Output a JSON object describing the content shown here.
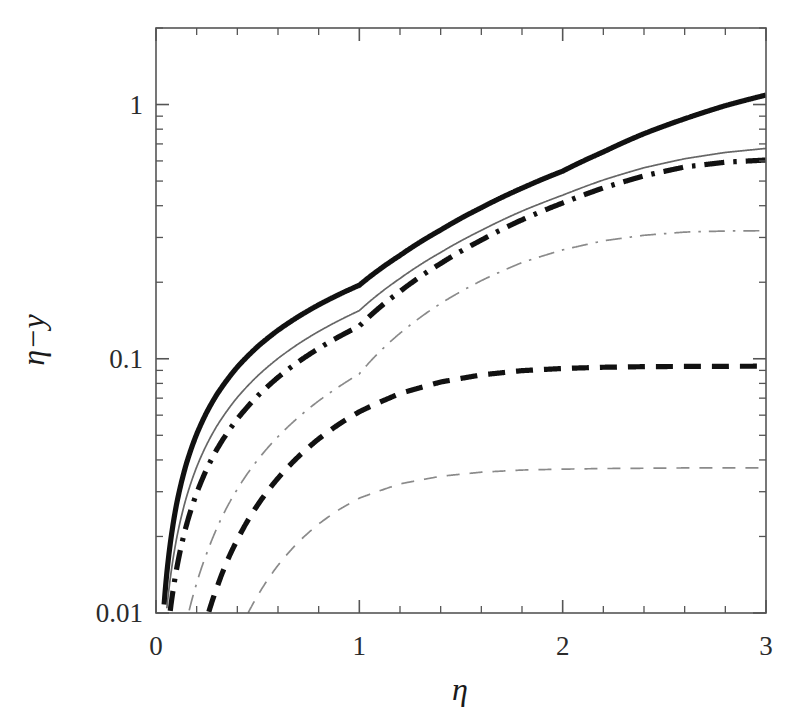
{
  "figure": {
    "background_color": "#ffffff",
    "ink_color": "#1a1a1a",
    "light_ink_color": "#6a6a6a",
    "axis_color": "#555555"
  },
  "axes": {
    "x_label": "η",
    "y_label": "η−y",
    "x_scale": "linear",
    "y_scale": "log",
    "xlim": [
      0,
      3
    ],
    "ylim": [
      0.01,
      2.0
    ],
    "x_major_ticks": [
      0,
      1,
      2,
      3
    ],
    "x_major_tick_labels": [
      "0",
      "1",
      "2",
      "3"
    ],
    "x_minor_tick_step": 0.2,
    "y_major_ticks": [
      0.01,
      0.1,
      1
    ],
    "y_major_tick_labels": [
      "0.01",
      "0.1",
      "1"
    ],
    "y_minor_decade_multipliers": [
      2,
      3,
      4,
      5,
      6,
      7,
      8,
      9
    ],
    "grid": false,
    "frame": "box",
    "ticks_direction": "in"
  },
  "chart_data": {
    "type": "line",
    "title": "",
    "subtitle": "",
    "xlabel": "η",
    "ylabel": "η−y",
    "xlim": [
      0,
      3
    ],
    "ylim": [
      0.01,
      2.0
    ],
    "x_scale": "linear",
    "y_scale": "log",
    "grid": false,
    "legend": "none",
    "annotations": [],
    "x": [
      0.0,
      0.05,
      0.1,
      0.15,
      0.2,
      0.25,
      0.3,
      0.4,
      0.5,
      0.6,
      0.7,
      0.8,
      0.9,
      1.0,
      1.2,
      1.4,
      1.6,
      1.8,
      2.0,
      2.2,
      2.4,
      2.6,
      2.8,
      3.0
    ],
    "series": [
      {
        "name": "curve-1",
        "style": "solid",
        "width": "thick",
        "color": "#111111",
        "asymptote": 1.09,
        "values": [
          0.0,
          0.0135,
          0.0265,
          0.0388,
          0.0505,
          0.0617,
          0.0725,
          0.0928,
          0.1117,
          0.1295,
          0.1465,
          0.163,
          0.179,
          0.1947,
          0.255,
          0.321,
          0.393,
          0.469,
          0.547,
          0.651,
          0.768,
          0.879,
          0.99,
          1.09
        ]
      },
      {
        "name": "curve-2",
        "style": "solid",
        "width": "thin",
        "color": "#666666",
        "asymptote": 0.672,
        "values": [
          0.0,
          0.0098,
          0.0194,
          0.0286,
          0.0375,
          0.0461,
          0.0545,
          0.0705,
          0.0857,
          0.1003,
          0.1144,
          0.1281,
          0.1415,
          0.1547,
          0.207,
          0.262,
          0.32,
          0.381,
          0.44,
          0.505,
          0.564,
          0.612,
          0.648,
          0.672
        ]
      },
      {
        "name": "curve-3",
        "style": "dash-dot",
        "width": "thick",
        "color": "#111111",
        "asymptote": 0.605,
        "values": [
          0.0,
          0.0072,
          0.0147,
          0.0222,
          0.0296,
          0.0369,
          0.0441,
          0.058,
          0.0714,
          0.0845,
          0.0973,
          0.1098,
          0.1222,
          0.1344,
          0.184,
          0.237,
          0.293,
          0.352,
          0.41,
          0.47,
          0.524,
          0.568,
          0.593,
          0.605
        ]
      },
      {
        "name": "curve-4",
        "style": "dash-dot",
        "width": "thin",
        "color": "#8a8a8a",
        "asymptote": 0.319,
        "values": [
          0.0,
          0.0026,
          0.0057,
          0.0092,
          0.0131,
          0.0172,
          0.0216,
          0.0307,
          0.04,
          0.0494,
          0.0588,
          0.0683,
          0.0777,
          0.0872,
          0.126,
          0.165,
          0.203,
          0.239,
          0.268,
          0.291,
          0.306,
          0.315,
          0.318,
          0.319
        ]
      },
      {
        "name": "curve-5",
        "style": "dashed",
        "width": "thick",
        "color": "#111111",
        "asymptote": 0.0935,
        "values": [
          0.0,
          0.0008,
          0.0022,
          0.0042,
          0.0067,
          0.0095,
          0.0126,
          0.0194,
          0.0266,
          0.0339,
          0.0412,
          0.0484,
          0.0553,
          0.0619,
          0.073,
          0.081,
          0.0864,
          0.0898,
          0.0916,
          0.0926,
          0.0931,
          0.0933,
          0.0934,
          0.0935
        ]
      },
      {
        "name": "curve-6",
        "style": "dashed",
        "width": "thin",
        "color": "#8a8a8a",
        "asymptote": 0.0372,
        "values": [
          0.0,
          0.0002,
          0.0006,
          0.0013,
          0.0022,
          0.0034,
          0.0048,
          0.0081,
          0.0117,
          0.0154,
          0.019,
          0.0224,
          0.0255,
          0.0283,
          0.0322,
          0.0345,
          0.0358,
          0.0365,
          0.0368,
          0.037,
          0.0371,
          0.0372,
          0.0372,
          0.0372
        ]
      }
    ]
  }
}
